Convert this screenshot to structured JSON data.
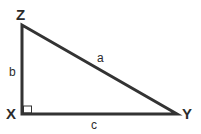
{
  "diagram": {
    "type": "right-triangle",
    "stroke_color": "#333333",
    "vertices": {
      "top": "Z",
      "right_angle": "X",
      "right": "Y"
    },
    "sides": {
      "hypotenuse": "a",
      "vertical": "b",
      "horizontal": "c"
    },
    "right_angle_marker": "X"
  }
}
